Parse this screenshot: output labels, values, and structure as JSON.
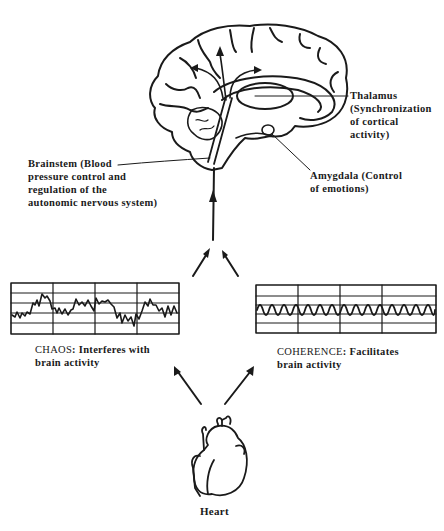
{
  "diagram": {
    "labels": {
      "thalamus": [
        "Thalamus",
        "(Synchronization",
        "of cortical",
        "activity)"
      ],
      "amygdala": [
        "Amygdala (Control",
        "of emotions)"
      ],
      "brainstem": [
        "Brainstem (Blood",
        "pressure control and",
        "regulation of the",
        "autonomic nervous system)"
      ]
    },
    "chaos": {
      "caption_lead": "CHAOS",
      "caption_line1_rest": ": Interferes with",
      "caption_line2": "brain activity"
    },
    "coherence": {
      "caption_lead": "COHERENCE",
      "caption_line1_rest": ": Facilitates",
      "caption_line2": "brain activity"
    },
    "heart": {
      "label": "Heart"
    },
    "icons": [
      "brain-illustration",
      "heart-illustration",
      "arrow-up",
      "arrow-diagonal"
    ],
    "colors": {
      "ink": "#1a1a1a",
      "background": "#ffffff"
    }
  }
}
